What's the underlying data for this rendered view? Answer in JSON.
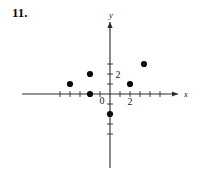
{
  "problem": {
    "number": "11."
  },
  "chart_data": {
    "type": "scatter",
    "title": "",
    "xlabel": "x",
    "ylabel": "y",
    "grid": false,
    "legend": null,
    "xlim": [
      -5,
      5
    ],
    "ylim": [
      -4,
      4
    ],
    "x_tick_labels": [
      {
        "value": 2,
        "text": "2"
      }
    ],
    "y_tick_labels": [
      {
        "value": 2,
        "text": "2"
      }
    ],
    "origin_label": "0",
    "x_ticks": [
      -5,
      -4,
      -3,
      -2,
      -1,
      1,
      2,
      3,
      4,
      5
    ],
    "y_ticks": [
      -4,
      -3,
      -2,
      -1,
      1,
      2,
      3
    ],
    "points": [
      {
        "x": -4,
        "y": 1
      },
      {
        "x": -2,
        "y": 2
      },
      {
        "x": -2,
        "y": 0
      },
      {
        "x": 0,
        "y": -2
      },
      {
        "x": 2,
        "y": 1
      },
      {
        "x": 3.4,
        "y": 3
      }
    ]
  },
  "style": {
    "axis_color": "#2a2a2a",
    "point_color": "#0a0a0a",
    "text_color": "#1a1a1a",
    "background": "#ffffff"
  }
}
